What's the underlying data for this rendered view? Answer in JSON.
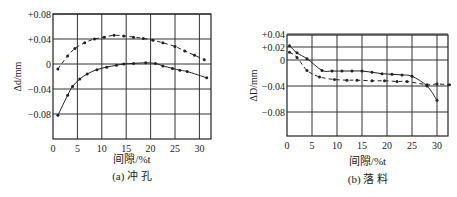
{
  "chart_data": [
    {
      "type": "line",
      "title": "(a) 冲 孔",
      "xlabel": "间隙/%t",
      "ylabel": "Δd/mm",
      "xlim": [
        0,
        32.5
      ],
      "ylim": [
        -0.1,
        0.08
      ],
      "x_ticks": [
        0,
        5,
        10,
        15,
        20,
        25,
        30
      ],
      "y_ticks": [
        0.08,
        0.04,
        0,
        -0.04,
        -0.08
      ],
      "y_tick_labels": [
        "+0.08",
        "+0.04",
        "0",
        "−0.04",
        "−0.08"
      ],
      "x_tick_labels": [
        "0",
        "5",
        "10",
        "15",
        "20",
        "25",
        "30"
      ],
      "grid": true,
      "series": [
        {
          "name": "dashed",
          "style": "dashed",
          "x": [
            1,
            3,
            4.5,
            6.5,
            8.5,
            10.5,
            12.5,
            14.5,
            16.5,
            18.5,
            20.5,
            22.5,
            25,
            27,
            29,
            31
          ],
          "y": [
            -0.008,
            0.013,
            0.025,
            0.034,
            0.04,
            0.043,
            0.046,
            0.045,
            0.043,
            0.041,
            0.038,
            0.034,
            0.028,
            0.021,
            0.014,
            0.007
          ]
        },
        {
          "name": "solid",
          "style": "solid",
          "x": [
            1,
            3,
            4,
            5.5,
            7,
            9,
            11,
            13,
            14.5,
            16.5,
            19,
            21,
            22.5,
            24.5,
            26,
            27.5,
            31.5
          ],
          "y": [
            -0.082,
            -0.05,
            -0.036,
            -0.024,
            -0.016,
            -0.009,
            -0.005,
            -0.002,
            0.0,
            0.001,
            0.002,
            0.001,
            -0.003,
            -0.007,
            -0.01,
            -0.012,
            -0.022
          ]
        }
      ]
    },
    {
      "type": "line",
      "title": "(b) 落 料",
      "xlabel": "间隙/%t",
      "ylabel": "ΔD/mm",
      "xlim": [
        0,
        32.5
      ],
      "ylim": [
        -0.1,
        0.04
      ],
      "x_ticks": [
        0,
        5,
        10,
        15,
        20,
        25,
        30
      ],
      "y_ticks": [
        0.04,
        0.02,
        0,
        -0.04,
        -0.08
      ],
      "y_tick_labels": [
        "+0.04",
        "+0.02",
        "0",
        "−0.04",
        "−0.08"
      ],
      "x_tick_labels": [
        "0",
        "5",
        "10",
        "15",
        "20",
        "25",
        "30"
      ],
      "grid": true,
      "series": [
        {
          "name": "solid",
          "style": "solid",
          "x": [
            0.5,
            2,
            4,
            7,
            9,
            11,
            13,
            15,
            17,
            19,
            21,
            23,
            25,
            28,
            30
          ],
          "y": [
            0.022,
            0.011,
            0.002,
            -0.016,
            -0.017,
            -0.017,
            -0.017,
            -0.017,
            -0.019,
            -0.021,
            -0.022,
            -0.023,
            -0.025,
            -0.04,
            -0.062
          ]
        },
        {
          "name": "dashed",
          "style": "dashed",
          "x": [
            0.5,
            2,
            4,
            6.5,
            9.5,
            12,
            14,
            17,
            19.5,
            22,
            24,
            28,
            30,
            32.5
          ],
          "y": [
            0.012,
            0.004,
            -0.016,
            -0.026,
            -0.03,
            -0.031,
            -0.031,
            -0.032,
            -0.032,
            -0.033,
            -0.033,
            -0.038,
            -0.037,
            -0.038
          ]
        }
      ]
    }
  ]
}
